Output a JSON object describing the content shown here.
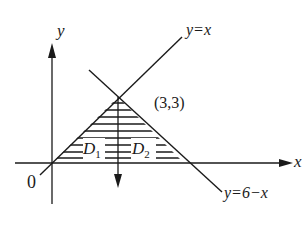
{
  "figure": {
    "axes": {
      "x_label": "x",
      "y_label": "y",
      "origin_label": "0"
    },
    "lines": [
      {
        "id": "line-y-eq-x",
        "label": "y=x"
      },
      {
        "id": "line-y-eq-6-minus-x",
        "label": "y=6−x"
      }
    ],
    "point": {
      "label": "(3,3)",
      "x": 3,
      "y": 3
    },
    "regions": [
      {
        "id": "D1",
        "symbol": "D",
        "subscript": "1"
      },
      {
        "id": "D2",
        "symbol": "D",
        "subscript": "2"
      }
    ],
    "colors": {
      "ink": "#1a1a1a",
      "background": "#ffffff"
    }
  }
}
